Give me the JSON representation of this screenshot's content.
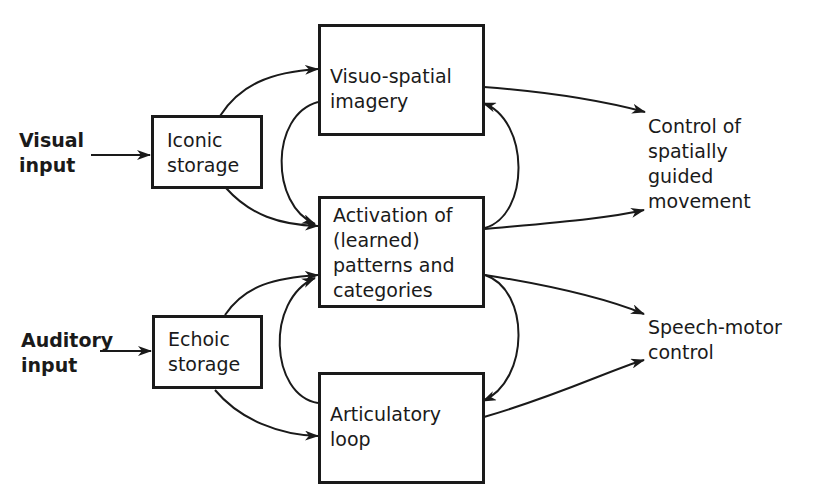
{
  "inputs": {
    "visual": "Visual\ninput",
    "auditory": "Auditory\ninput"
  },
  "boxes": {
    "iconic": "Iconic\nstorage",
    "echoic": "Echoic\nstorage",
    "visuo_spatial": "Visuo-spatial\nimagery",
    "activation": "Activation of\n(learned)\npatterns and\ncategories",
    "articulatory": "Articulatory\nloop"
  },
  "outputs": {
    "spatial_control": "Control of\nspatially\nguided\nmovement",
    "speech_motor": "Speech-motor\ncontrol"
  },
  "colors": {
    "ink": "#1a1a1a",
    "background": "#ffffff"
  }
}
